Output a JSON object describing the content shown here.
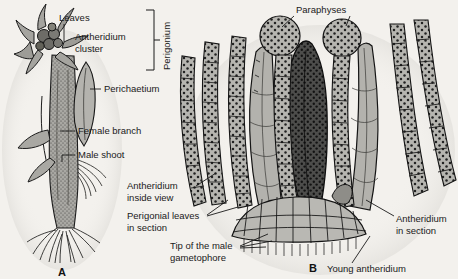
{
  "figure": {
    "background_color": "#f3f1ed",
    "ink_color": "#1a1a1a",
    "tissue_fill": "#a8a8a4",
    "tissue_fill_dark": "#4a4a48",
    "tissue_fill_light": "#c9c8c3"
  },
  "panels": [
    {
      "id": "panel-a",
      "letter": "A",
      "caption": "Whole moss shoot with male and female branches"
    },
    {
      "id": "panel-b",
      "letter": "B",
      "caption": "Longitudinal section through perigonium"
    }
  ],
  "labels_left": [
    {
      "name": "leaves",
      "text": "Leaves"
    },
    {
      "name": "antheridium-cluster-line1",
      "text": "Antheridium"
    },
    {
      "name": "antheridium-cluster-line2",
      "text": "cluster"
    },
    {
      "name": "perigonium",
      "text": "Perigonium"
    },
    {
      "name": "perichaetium",
      "text": "Perichaetium"
    },
    {
      "name": "female-branch",
      "text": "Female branch"
    },
    {
      "name": "male-shoot",
      "text": "Male shoot"
    }
  ],
  "labels_right": [
    {
      "name": "paraphyses",
      "text": "Paraphyses"
    },
    {
      "name": "antheridium-inside-view-l1",
      "text": "Antheridium"
    },
    {
      "name": "antheridium-inside-view-l2",
      "text": "inside view"
    },
    {
      "name": "perigonial-leaves-l1",
      "text": "Perigonial leaves"
    },
    {
      "name": "perigonial-leaves-l2",
      "text": "in section"
    },
    {
      "name": "tip-of-male-gametophore-l1",
      "text": "Tip of the male"
    },
    {
      "name": "tip-of-male-gametophore-l2",
      "text": "gametophore"
    },
    {
      "name": "antheridium-in-section-l1",
      "text": "Antheridium"
    },
    {
      "name": "antheridium-in-section-l2",
      "text": "in section"
    },
    {
      "name": "young-antheridium",
      "text": "Young antheridium"
    }
  ]
}
